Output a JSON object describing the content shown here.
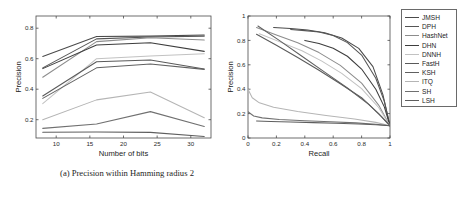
{
  "chart_data": [
    {
      "panel": "a",
      "type": "line",
      "title": "",
      "caption": "(a) Precision within Hamming radius 2",
      "xlabel": "Number of bits",
      "ylabel": "Precision",
      "x": [
        8,
        16,
        24,
        32
      ],
      "xlim": [
        7,
        33
      ],
      "ylim": [
        0.08,
        0.88
      ],
      "xticks": [
        10,
        15,
        20,
        25,
        30
      ],
      "yticks": [
        0.2,
        0.4,
        0.6,
        0.8
      ],
      "grid": false,
      "series": [
        {
          "name": "JMSH",
          "color": "#4a4a4a",
          "values": [
            0.615,
            0.745,
            0.748,
            0.755
          ]
        },
        {
          "name": "DPH",
          "color": "#555555",
          "values": [
            0.54,
            0.73,
            0.742,
            0.748
          ]
        },
        {
          "name": "HashNet",
          "color": "#8c8c8c",
          "values": [
            0.478,
            0.712,
            0.738,
            0.722
          ]
        },
        {
          "name": "DHN",
          "color": "#3d3d3d",
          "values": [
            0.535,
            0.69,
            0.705,
            0.648
          ]
        },
        {
          "name": "DNNH",
          "color": "#c2c2c2",
          "values": [
            0.305,
            0.6,
            0.618,
            0.632
          ]
        },
        {
          "name": "FastH",
          "color": "#5a5a5a",
          "values": [
            0.355,
            0.58,
            0.592,
            0.533
          ]
        },
        {
          "name": "KSH",
          "color": "#606060",
          "values": [
            0.34,
            0.54,
            0.565,
            0.53
          ]
        },
        {
          "name": "ITQ",
          "color": "#b5b5b5",
          "values": [
            0.2,
            0.33,
            0.382,
            0.213
          ]
        },
        {
          "name": "SH",
          "color": "#707070",
          "values": [
            0.143,
            0.172,
            0.253,
            0.155
          ]
        },
        {
          "name": "LSH",
          "color": "#5e5e5e",
          "values": [
            0.118,
            0.12,
            0.117,
            0.09
          ]
        }
      ]
    },
    {
      "panel": "b",
      "type": "line",
      "title": "",
      "caption": "(b) Precision-recall curve @ 16 bits",
      "xlabel": "Recall",
      "ylabel": "Precision",
      "xlim": [
        0,
        1
      ],
      "ylim": [
        0,
        1
      ],
      "xticks": [
        0,
        0.2,
        0.4,
        0.6,
        0.8,
        1
      ],
      "yticks": [
        0,
        0.2,
        0.4,
        0.6,
        0.8,
        1
      ],
      "grid": false,
      "series": [
        {
          "name": "JMSH",
          "color": "#4a4a4a",
          "x": [
            0.18,
            0.3,
            0.42,
            0.54,
            0.66,
            0.78,
            0.88,
            0.95,
            1.0
          ],
          "y": [
            0.905,
            0.898,
            0.885,
            0.862,
            0.82,
            0.735,
            0.585,
            0.355,
            0.1
          ]
        },
        {
          "name": "DPH",
          "color": "#555555",
          "x": [
            0.3,
            0.4,
            0.5,
            0.6,
            0.7,
            0.8,
            0.9,
            0.96,
            1.0
          ],
          "y": [
            0.89,
            0.88,
            0.868,
            0.84,
            0.782,
            0.68,
            0.49,
            0.3,
            0.1
          ]
        },
        {
          "name": "HashNet",
          "color": "#8c8c8c",
          "x": [
            0.06,
            0.2,
            0.35,
            0.5,
            0.65,
            0.8,
            0.92,
            1.0
          ],
          "y": [
            0.905,
            0.845,
            0.78,
            0.7,
            0.595,
            0.45,
            0.27,
            0.1
          ]
        },
        {
          "name": "DHN",
          "color": "#3d3d3d",
          "x": [
            0.4,
            0.5,
            0.6,
            0.7,
            0.8,
            0.9,
            0.96,
            1.0
          ],
          "y": [
            0.8,
            0.775,
            0.735,
            0.67,
            0.565,
            0.4,
            0.255,
            0.1
          ]
        },
        {
          "name": "DNNH",
          "color": "#c2c2c2",
          "x": [
            0.08,
            0.22,
            0.38,
            0.52,
            0.66,
            0.8,
            0.92,
            1.0
          ],
          "y": [
            0.855,
            0.79,
            0.715,
            0.63,
            0.53,
            0.405,
            0.25,
            0.1
          ]
        },
        {
          "name": "FastH",
          "color": "#5a5a5a",
          "x": [
            0.06,
            0.2,
            0.35,
            0.5,
            0.65,
            0.8,
            0.92,
            1.0
          ],
          "y": [
            0.85,
            0.76,
            0.66,
            0.555,
            0.445,
            0.33,
            0.2,
            0.1
          ]
        },
        {
          "name": "KSH",
          "color": "#606060",
          "x": [
            0.07,
            0.22,
            0.38,
            0.54,
            0.7,
            0.85,
            0.94,
            1.0
          ],
          "y": [
            0.918,
            0.8,
            0.67,
            0.54,
            0.41,
            0.275,
            0.175,
            0.1
          ]
        },
        {
          "name": "ITQ",
          "color": "#b5b5b5",
          "x": [
            0.0,
            0.03,
            0.08,
            0.18,
            0.35,
            0.55,
            0.75,
            0.9,
            1.0
          ],
          "y": [
            0.4,
            0.33,
            0.288,
            0.252,
            0.218,
            0.185,
            0.155,
            0.128,
            0.1
          ]
        },
        {
          "name": "SH",
          "color": "#707070",
          "x": [
            0.0,
            0.04,
            0.1,
            0.22,
            0.4,
            0.58,
            0.76,
            0.9,
            1.0
          ],
          "y": [
            0.215,
            0.18,
            0.165,
            0.152,
            0.142,
            0.133,
            0.124,
            0.113,
            0.1
          ]
        },
        {
          "name": "LSH",
          "color": "#5e5e5e",
          "x": [
            0.06,
            0.16,
            0.3,
            0.46,
            0.62,
            0.78,
            0.9,
            1.0
          ],
          "y": [
            0.14,
            0.136,
            0.131,
            0.126,
            0.121,
            0.115,
            0.108,
            0.1
          ]
        }
      ]
    }
  ],
  "legend": {
    "position": "right",
    "items": [
      {
        "label": "JMSH",
        "color": "#4a4a4a"
      },
      {
        "label": "DPH",
        "color": "#555555"
      },
      {
        "label": "HashNet",
        "color": "#8c8c8c"
      },
      {
        "label": "DHN",
        "color": "#3d3d3d"
      },
      {
        "label": "DNNH",
        "color": "#c2c2c2"
      },
      {
        "label": "FastH",
        "color": "#5a5a5a"
      },
      {
        "label": "KSH",
        "color": "#606060"
      },
      {
        "label": "ITQ",
        "color": "#b5b5b5"
      },
      {
        "label": "SH",
        "color": "#707070"
      },
      {
        "label": "LSH",
        "color": "#5e5e5e"
      }
    ]
  }
}
